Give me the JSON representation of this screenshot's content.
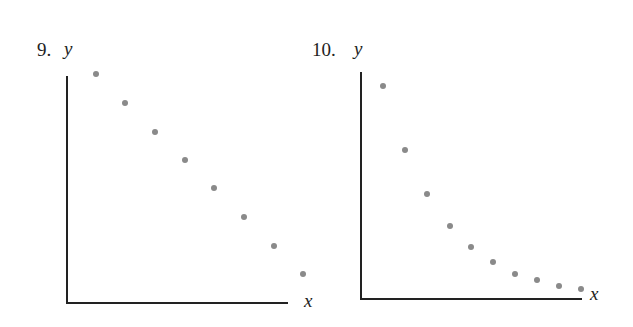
{
  "chart_data": [
    {
      "type": "scatter",
      "number": "9.",
      "title": "",
      "xlabel": "x",
      "ylabel": "y",
      "grid": false,
      "ticks": false,
      "trend": "linear decreasing",
      "x": [
        1,
        2,
        3,
        4,
        5,
        6,
        7,
        8
      ],
      "y": [
        8,
        7,
        6,
        5,
        4,
        3,
        2,
        1
      ],
      "px": [
        [
          96,
          74
        ],
        [
          125,
          103
        ],
        [
          155,
          132
        ],
        [
          185,
          160
        ],
        [
          214,
          188
        ],
        [
          244,
          217
        ],
        [
          274,
          246
        ],
        [
          303,
          274
        ]
      ]
    },
    {
      "type": "scatter",
      "number": "10.",
      "title": "",
      "xlabel": "x",
      "ylabel": "y",
      "grid": false,
      "ticks": false,
      "trend": "nonlinear decreasing (decaying)",
      "x": [
        1,
        2,
        3,
        4,
        5,
        6,
        7,
        8,
        9,
        10
      ],
      "y": [
        9.4,
        6.6,
        4.7,
        3.2,
        2.3,
        1.7,
        1.1,
        0.8,
        0.6,
        0.4
      ],
      "px": [
        [
          383,
          86
        ],
        [
          405,
          150
        ],
        [
          427,
          194
        ],
        [
          450,
          226
        ],
        [
          471,
          247
        ],
        [
          493,
          262
        ],
        [
          515,
          274
        ],
        [
          537,
          280
        ],
        [
          559,
          286
        ],
        [
          581,
          289
        ]
      ]
    }
  ],
  "colors": {
    "axis": "#222222",
    "point": "#8a8a8a"
  }
}
